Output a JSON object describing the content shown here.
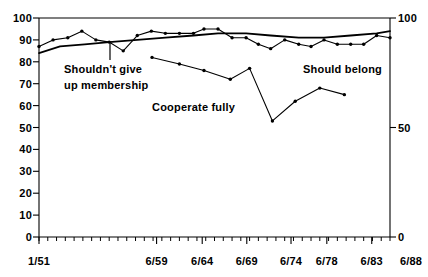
{
  "chart_data": {
    "type": "line",
    "title": "",
    "xlabel": "",
    "ylabel": "",
    "ylim": [
      0,
      100
    ],
    "y_right_lim": [
      0,
      100
    ],
    "grid": false,
    "legend": "inline-annotations",
    "y_ticks_left": [
      "0",
      "10",
      "20",
      "30",
      "40",
      "50",
      "60",
      "70",
      "80",
      "90",
      "100"
    ],
    "y_ticks_right": [
      "0",
      "50",
      "100"
    ],
    "x_ticks": [
      "1/51",
      "6/59",
      "6/64",
      "6/69",
      "6/74",
      "6/78",
      "6/83",
      "6/88"
    ],
    "x_tick_positions": [
      0.0,
      0.335,
      0.465,
      0.592,
      0.718,
      0.82,
      0.948,
      1.052
    ],
    "annotations": [
      {
        "name": "shouldnt-give-up-membership",
        "line1": "Shouldn't give",
        "line2": "up membership"
      },
      {
        "name": "cooperate-fully",
        "line1": "Cooperate fully",
        "line2": ""
      },
      {
        "name": "should-belong",
        "line1": "Should belong",
        "line2": ""
      }
    ],
    "series": [
      {
        "name": "Shouldn't give up membership / Should belong",
        "marker": "dot",
        "x": [
          0.0,
          0.04,
          0.082,
          0.122,
          0.162,
          0.2,
          0.24,
          0.28,
          0.32,
          0.36,
          0.4,
          0.44,
          0.47,
          0.51,
          0.55,
          0.59,
          0.625,
          0.66,
          0.7,
          0.74,
          0.775,
          0.812,
          0.85,
          0.888,
          0.925,
          0.962,
          1.0
        ],
        "values": [
          87,
          90,
          91,
          94,
          90,
          89,
          85,
          92,
          94,
          93,
          93,
          93,
          95,
          95,
          91,
          91,
          88,
          86,
          90,
          88,
          87,
          90,
          88,
          88,
          88,
          92,
          91
        ]
      },
      {
        "name": "trend",
        "marker": "none",
        "x": [
          0.0,
          0.06,
          0.13,
          0.2,
          0.28,
          0.36,
          0.44,
          0.51,
          0.59,
          0.66,
          0.74,
          0.812,
          0.888,
          0.962,
          1.0
        ],
        "values": [
          84,
          87,
          88,
          89,
          90,
          91,
          92,
          93,
          93,
          92,
          91,
          91,
          92,
          93,
          94
        ]
      },
      {
        "name": "Cooperate fully",
        "marker": "dot",
        "x": [
          0.322,
          0.4,
          0.47,
          0.545,
          0.6,
          0.665,
          0.73,
          0.8,
          0.87
        ],
        "values": [
          82,
          79,
          76,
          72,
          77,
          53,
          62,
          68,
          65
        ]
      }
    ]
  }
}
